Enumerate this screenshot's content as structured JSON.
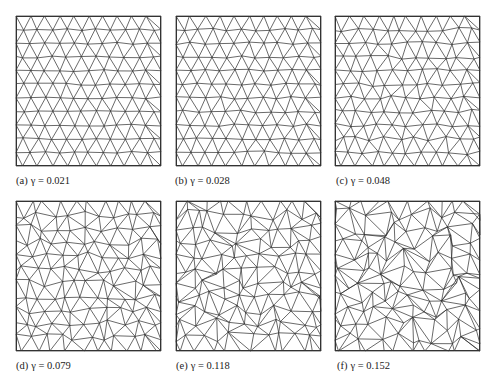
{
  "figure": {
    "panels": [
      {
        "id": "a",
        "label": "(a)",
        "caption": "γ = 0.021",
        "gamma": 0.021
      },
      {
        "id": "b",
        "label": "(b)",
        "caption": "γ = 0.028",
        "gamma": 0.028
      },
      {
        "id": "c",
        "label": "(c)",
        "caption": "γ = 0.048",
        "gamma": 0.048
      },
      {
        "id": "d",
        "label": "(d)",
        "caption": "γ = 0.079",
        "gamma": 0.079
      },
      {
        "id": "e",
        "label": "(e)",
        "caption": "γ = 0.118",
        "gamma": 0.118
      },
      {
        "id": "f",
        "label": "(f)",
        "caption": "γ = 0.152",
        "gamma": 0.152
      }
    ],
    "mesh_color": "#2a2a2a",
    "frame_color": "#333333"
  }
}
